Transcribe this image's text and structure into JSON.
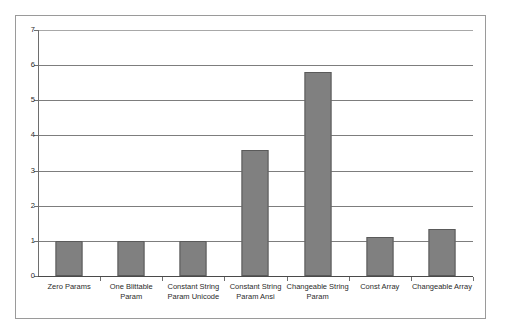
{
  "chart_data": {
    "type": "bar",
    "title": "",
    "subtitle": "",
    "xlabel": "",
    "ylabel": "",
    "categories": [
      "Zero Params",
      "One Blittable Param",
      "Constant String Param Unicode",
      "Constant String Param Ansi",
      "Changeable String Param",
      "Const Array",
      "Changeable Array"
    ],
    "values": [
      1.0,
      1.0,
      1.0,
      3.6,
      5.8,
      1.1,
      1.35
    ],
    "ylim": [
      0,
      7
    ],
    "yticks": [
      0,
      1,
      2,
      3,
      4,
      5,
      6,
      7
    ],
    "ytick_labels": [
      "0",
      "1",
      "2",
      "3",
      "4",
      "5",
      "6",
      "7"
    ],
    "grid": true,
    "grid_axis": "y",
    "legend": false,
    "legend_position": "none",
    "bar_color": "#808080",
    "bar_border_color": "#5a5a5a",
    "gridline_color": "#7d7d7d",
    "axis_color": "#6e6e6e",
    "frame_color": "#9a9a9a",
    "plot_background": "#ffffff",
    "figure_background": "#ffffff",
    "series": [
      {
        "name": "Relative Cost",
        "values": [
          1.0,
          1.0,
          1.0,
          3.6,
          5.8,
          1.1,
          1.35
        ]
      }
    ]
  }
}
